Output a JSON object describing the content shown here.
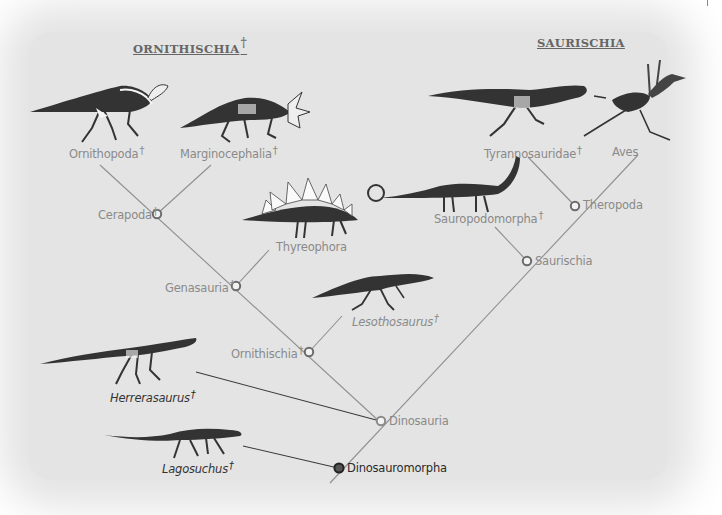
{
  "headings": {
    "ornithischia": "ORNITHISCHIA",
    "saurischia": "SAURISCHIA",
    "extinct_mark": "†"
  },
  "taxa": {
    "ornithopoda": {
      "label": "Ornithopoda",
      "extinct": "†"
    },
    "marginocephalia": {
      "label": "Marginocephalia",
      "extinct": "†"
    },
    "thyreophora": {
      "label": "Thyreophora"
    },
    "lesothosaurus": {
      "label": "Lesothosaurus",
      "extinct": "†"
    },
    "tyrannosauridae": {
      "label": "Tyrannosauridae",
      "extinct": "†"
    },
    "aves": {
      "label": "Aves"
    },
    "sauropodomorpha": {
      "label": "Sauropodomorpha",
      "extinct": "†"
    },
    "herrerasaurus": {
      "label": "Herrerasaurus",
      "extinct": "†"
    },
    "lagosuchus": {
      "label": "Lagosuchus",
      "extinct": "†"
    }
  },
  "nodes": {
    "cerapoda": {
      "label": "Cerapoda",
      "extinct": "†"
    },
    "genasauria": {
      "label": "Genasauria",
      "extinct": "†"
    },
    "ornithischia": {
      "label": "Ornithischia",
      "extinct": "†"
    },
    "theropoda": {
      "label": "Theropoda"
    },
    "saurischia": {
      "label": "Saurischia"
    },
    "dinosauria": {
      "label": "Dinosauria"
    },
    "dinosauromorpha": {
      "label": "Dinosauromorpha"
    }
  },
  "colors": {
    "background": "#e4e4e4",
    "branch_line": "#8f8f8f",
    "dark_line": "#3a3a3a",
    "label_grey": "#8a8a8a",
    "label_dark": "#2a2a2a"
  }
}
